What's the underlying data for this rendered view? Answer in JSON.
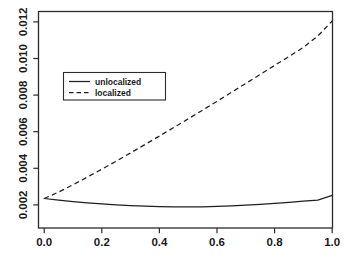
{
  "chart_data": {
    "type": "line",
    "title": "",
    "subtitle": "",
    "xlabel": "",
    "ylabel": "",
    "xlim": [
      0.0,
      1.0
    ],
    "ylim": [
      0.00165,
      0.01245
    ],
    "grid": false,
    "legend_position": "upper-left-inside",
    "x_tick_labels": [
      "0.0",
      "0.2",
      "0.4",
      "0.6",
      "0.8",
      "1.0"
    ],
    "x_ticks": [
      0.0,
      0.2,
      0.4,
      0.6,
      0.8,
      1.0
    ],
    "y_tick_labels": [
      "0.002",
      "0.004",
      "0.006",
      "0.008",
      "0.010",
      "0.012"
    ],
    "y_ticks": [
      0.002,
      0.004,
      0.006,
      0.008,
      0.01,
      0.012
    ],
    "x": [
      0.0,
      0.05,
      0.1,
      0.15,
      0.2,
      0.25,
      0.3,
      0.35,
      0.4,
      0.45,
      0.5,
      0.55,
      0.6,
      0.65,
      0.7,
      0.75,
      0.8,
      0.85,
      0.9,
      0.95,
      1.0
    ],
    "series": [
      {
        "name": "unlocalized",
        "style": "solid",
        "color": "#1f1f1f",
        "values": [
          0.00235,
          0.00226,
          0.00218,
          0.00211,
          0.002055,
          0.002005,
          0.001965,
          0.001932,
          0.001908,
          0.001893,
          0.001888,
          0.001895,
          0.001913,
          0.001943,
          0.001983,
          0.00203,
          0.002083,
          0.00214,
          0.0022,
          0.00226,
          0.00252
        ]
      },
      {
        "name": "localized",
        "style": "dashed",
        "color": "#1f1f1f",
        "values": [
          0.00235,
          0.0027,
          0.0031,
          0.00352,
          0.00395,
          0.00439,
          0.00484,
          0.0053,
          0.00576,
          0.00623,
          0.0067,
          0.00718,
          0.00766,
          0.00815,
          0.00864,
          0.00913,
          0.00962,
          0.01011,
          0.01061,
          0.01123,
          0.01205
        ]
      }
    ]
  },
  "legend": {
    "entries": [
      {
        "label": "unlocalized",
        "style": "solid"
      },
      {
        "label": "localized",
        "style": "dashed"
      }
    ]
  },
  "axes": {
    "x_labels": [
      "0.0",
      "0.2",
      "0.4",
      "0.6",
      "0.8",
      "1.0"
    ],
    "y_labels": [
      "0.002",
      "0.004",
      "0.006",
      "0.008",
      "0.010",
      "0.012"
    ]
  }
}
